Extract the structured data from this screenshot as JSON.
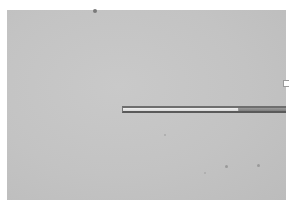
{
  "image": {
    "description": "Grayscale micrograph showing a thin glass capillary rod extending horizontally from the right edge into a uniform gray field",
    "background_color": "#c6c6c6",
    "border_color": "#ffffff",
    "rod": {
      "light_segment_color": "#e6e6e6",
      "dark_segment_color": "#8a8a8a",
      "outline_color": "#5e5e5e"
    }
  }
}
